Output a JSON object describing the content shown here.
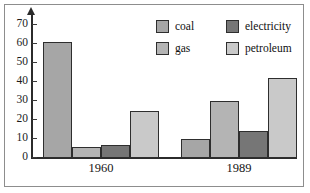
{
  "frame": {
    "border_color": "#8d8d8d",
    "background": "#ffffff"
  },
  "axes": {
    "y_ticks": [
      "0",
      "10",
      "20",
      "30",
      "40",
      "50",
      "60",
      "70"
    ],
    "y_min": 0,
    "y_max": 76,
    "axis_color": "#2b2b2b",
    "arrow": "up-arrow-icon"
  },
  "legend": {
    "items": [
      {
        "label": "coal",
        "color": "#a6a6a6",
        "swatch": "coal-swatch"
      },
      {
        "label": "electricity",
        "color": "#767676",
        "swatch": "electricity-swatch"
      },
      {
        "label": "gas",
        "color": "#b4b4b4",
        "swatch": "gas-swatch"
      },
      {
        "label": "petroleum",
        "color": "#c9c9c9",
        "swatch": "petroleum-swatch"
      }
    ]
  },
  "chart_data": {
    "type": "bar",
    "title": "",
    "xlabel": "",
    "ylabel": "",
    "categories": [
      "1960",
      "1989"
    ],
    "ylim": [
      0,
      76
    ],
    "yticks": [
      0,
      10,
      20,
      30,
      40,
      50,
      60,
      70
    ],
    "grid": false,
    "legend_position": "top-right",
    "series": [
      {
        "name": "coal",
        "color": "#a6a6a6",
        "values": [
          61,
          10
        ]
      },
      {
        "name": "gas",
        "color": "#b4b4b4",
        "values": [
          6,
          30
        ]
      },
      {
        "name": "electricity",
        "color": "#767676",
        "values": [
          7,
          14
        ]
      },
      {
        "name": "petroleum",
        "color": "#c9c9c9",
        "values": [
          25,
          42
        ]
      }
    ]
  }
}
